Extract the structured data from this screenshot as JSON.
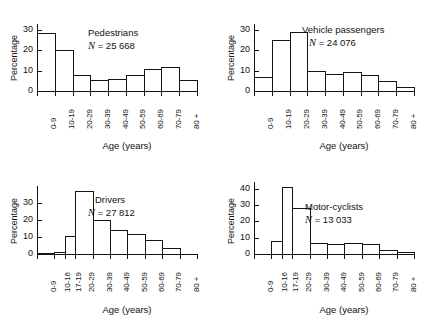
{
  "figure": {
    "axis_label_y": "Percentage",
    "axis_label_x": "Age (years)",
    "n_prefix": "N  =  "
  },
  "chart_data": [
    {
      "type": "bar",
      "title": "Pedestrians",
      "n_label": "25 668",
      "xlabel": "Age (years)",
      "ylabel": "Percentage",
      "ylim": [
        0,
        33
      ],
      "yticks": [
        0,
        10,
        20,
        30
      ],
      "grid": false,
      "categories": [
        "0-9",
        "10-19",
        "20-29",
        "30-39",
        "40-49",
        "50-59",
        "60-69",
        "70-79",
        "80 +"
      ],
      "values": [
        28.5,
        20,
        8,
        5.5,
        6,
        8,
        11,
        12,
        5.5
      ],
      "widths": [
        1,
        1,
        1,
        1,
        1,
        1,
        1,
        1,
        1
      ]
    },
    {
      "type": "bar",
      "title": "Vehicle passengers",
      "n_label": "24 076",
      "xlabel": "Age (years)",
      "ylabel": "Percentage",
      "ylim": [
        0,
        33
      ],
      "yticks": [
        0,
        10,
        20,
        30
      ],
      "grid": false,
      "categories": [
        "0-9",
        "10-19",
        "20-29",
        "30-39",
        "40-49",
        "50-59",
        "60-69",
        "70-79",
        "80 +"
      ],
      "values": [
        7,
        25,
        29,
        10,
        8.5,
        9.5,
        8,
        5,
        2
      ],
      "widths": [
        1,
        1,
        1,
        1,
        1,
        1,
        1,
        1,
        1
      ]
    },
    {
      "type": "bar",
      "title": "Drivers",
      "n_label": "27 812",
      "xlabel": "Age (years)",
      "ylabel": "Percentage",
      "ylim": [
        0,
        40
      ],
      "yticks": [
        0,
        10,
        20,
        30
      ],
      "grid": false,
      "categories": [
        "0-9",
        "10-16",
        "17-19",
        "20-29",
        "30-39",
        "40-49",
        "50-59",
        "60-69",
        "70-79",
        "80 +"
      ],
      "values": [
        0.4,
        1.2,
        10.5,
        37,
        20,
        14,
        12,
        8,
        3.5,
        0
      ],
      "widths": [
        1,
        0.6,
        0.6,
        1,
        1,
        1,
        1,
        1,
        1,
        1
      ]
    },
    {
      "type": "bar",
      "title": "Motor-cyclists",
      "n_label": "13 033",
      "xlabel": "Age (years)",
      "ylabel": "Percentage",
      "ylim": [
        0,
        44
      ],
      "yticks": [
        0,
        10,
        20,
        30,
        40
      ],
      "grid": false,
      "categories": [
        "0-9",
        "10-16",
        "17-19",
        "20-29",
        "30-39",
        "40-49",
        "50-59",
        "60-69",
        "70-79",
        "80 +"
      ],
      "values": [
        0,
        8,
        41,
        28,
        7,
        6,
        7,
        6,
        2.5,
        1.5
      ],
      "widths": [
        1,
        0.6,
        0.6,
        1,
        1,
        1,
        1,
        1,
        1,
        1
      ]
    }
  ]
}
